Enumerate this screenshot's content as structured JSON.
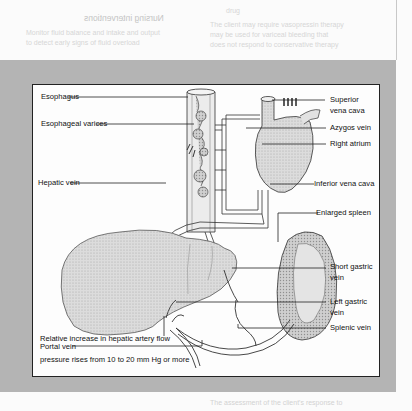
{
  "page": {
    "bleed_through_heading": "Nursing interventions",
    "bleed_through_lines_left": [
      "Monitor fluid balance and intake and output",
      "to detect early signs of fluid overload"
    ],
    "bleed_through_lines_right": [
      "drug",
      "The client may require vasopressin therapy",
      "may be used for variceal bleeding that",
      "does not respond to conservative therapy"
    ],
    "below_lines": [
      "",
      "The assessment of the client's response to"
    ]
  },
  "figure": {
    "labels": {
      "esophagus": "Esophagus",
      "esophageal_varices": "Esophageal varices",
      "hepatic_vein": "Hepatic vein",
      "superior_vena_cava_1": "Superior",
      "superior_vena_cava_2": "vena cava",
      "azygos_vein": "Azygos vein",
      "right_atrium": "Right atrium",
      "inferior_vena_cava": "Inferior vena cava",
      "enlarged_spleen": "Enlarged spleen",
      "short_gastric_vein_1": "Short gastric",
      "short_gastric_vein_2": "vein",
      "left_gastric_vein_1": "Left gastric",
      "left_gastric_vein_2": "vein",
      "splenic_vein": "Splenic vein",
      "hepatic_artery_flow": "Relative increase in hepatic artery flow",
      "portal_vein": "Portal vein",
      "portal_pressure": "pressure rises from  10 to 20 mm Hg or more"
    },
    "colors": {
      "band": "#b4b4b4",
      "box_bg": "#fdfdfd",
      "line": "#222222",
      "organ_fill": "#d9d9d9"
    }
  }
}
